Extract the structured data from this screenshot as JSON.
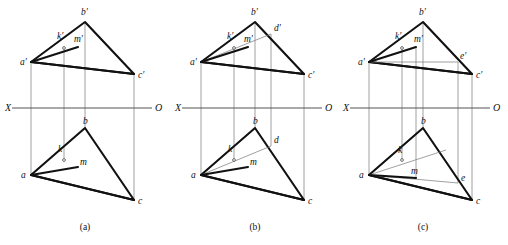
{
  "figure": {
    "background_color": "#ffffff",
    "line_color": "#111111",
    "axis_color": "#555555",
    "projector_color": "#888888",
    "panels": [
      {
        "id": "a",
        "caption": "(a)",
        "axis": {
          "left_label": "X",
          "right_label": "O"
        },
        "labels": [
          {
            "name": "a-prime",
            "text": "a′"
          },
          {
            "name": "b-prime",
            "text": "b′"
          },
          {
            "name": "c-prime",
            "text": "c′"
          },
          {
            "name": "k-prime",
            "text": "k′"
          },
          {
            "name": "m-prime",
            "text": "m′"
          },
          {
            "name": "a",
            "text": "a"
          },
          {
            "name": "b",
            "text": "b"
          },
          {
            "name": "c",
            "text": "c"
          },
          {
            "name": "k",
            "text": "k"
          },
          {
            "name": "m",
            "text": "m"
          }
        ]
      },
      {
        "id": "b",
        "caption": "(b)",
        "axis": {
          "left_label": "X",
          "right_label": "O"
        },
        "labels": [
          {
            "name": "a-prime",
            "text": "a′"
          },
          {
            "name": "b-prime",
            "text": "b′"
          },
          {
            "name": "c-prime",
            "text": "c′"
          },
          {
            "name": "d-prime",
            "text": "d′"
          },
          {
            "name": "k-prime",
            "text": "k′"
          },
          {
            "name": "m-prime",
            "text": "m′"
          },
          {
            "name": "a",
            "text": "a"
          },
          {
            "name": "b",
            "text": "b"
          },
          {
            "name": "c",
            "text": "c"
          },
          {
            "name": "d",
            "text": "d"
          },
          {
            "name": "k",
            "text": "k"
          },
          {
            "name": "m",
            "text": "m"
          }
        ]
      },
      {
        "id": "c",
        "caption": "(c)",
        "axis": {
          "left_label": "X",
          "right_label": "O"
        },
        "labels": [
          {
            "name": "a-prime",
            "text": "a′"
          },
          {
            "name": "b-prime",
            "text": "b′"
          },
          {
            "name": "c-prime",
            "text": "c′"
          },
          {
            "name": "e-prime",
            "text": "e′"
          },
          {
            "name": "k-prime",
            "text": "k′"
          },
          {
            "name": "m-prime",
            "text": "m′"
          },
          {
            "name": "a",
            "text": "a"
          },
          {
            "name": "b",
            "text": "b"
          },
          {
            "name": "c",
            "text": "c"
          },
          {
            "name": "e",
            "text": "e"
          },
          {
            "name": "k",
            "text": "k"
          },
          {
            "name": "m",
            "text": "m"
          }
        ]
      }
    ]
  }
}
